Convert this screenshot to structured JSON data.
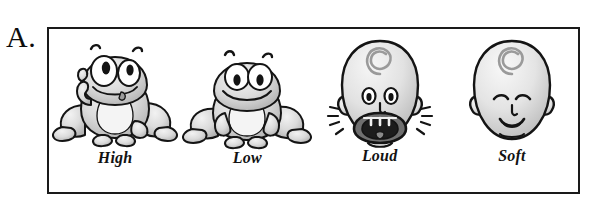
{
  "figure": {
    "panel_letter": "A.",
    "border_color": "#1a1a1a",
    "background_color": "#ffffff",
    "ink_color": "#121212",
    "fill_light": "#e8e8e8",
    "fill_mid": "#b8b8b8",
    "fill_dark": "#6e6e6e"
  },
  "cells": [
    {
      "label": "High",
      "icon": "frog-pointing-up-icon",
      "subject": "frog",
      "expression": "eyes-up-eyebrows-raised",
      "gesture": "one-hand-raised-finger-up"
    },
    {
      "label": "Low",
      "icon": "frog-sitting-icon",
      "subject": "frog",
      "expression": "eyes-down-smiling",
      "gesture": "both-hands-down"
    },
    {
      "label": "Loud",
      "icon": "baby-head-shouting-icon",
      "subject": "baby-head",
      "expression": "mouth-wide-open-shouting",
      "gesture": "sound-burst-lines"
    },
    {
      "label": "Soft",
      "icon": "baby-head-calm-icon",
      "subject": "baby-head",
      "expression": "eyes-closed-small-smile",
      "gesture": "none"
    }
  ]
}
